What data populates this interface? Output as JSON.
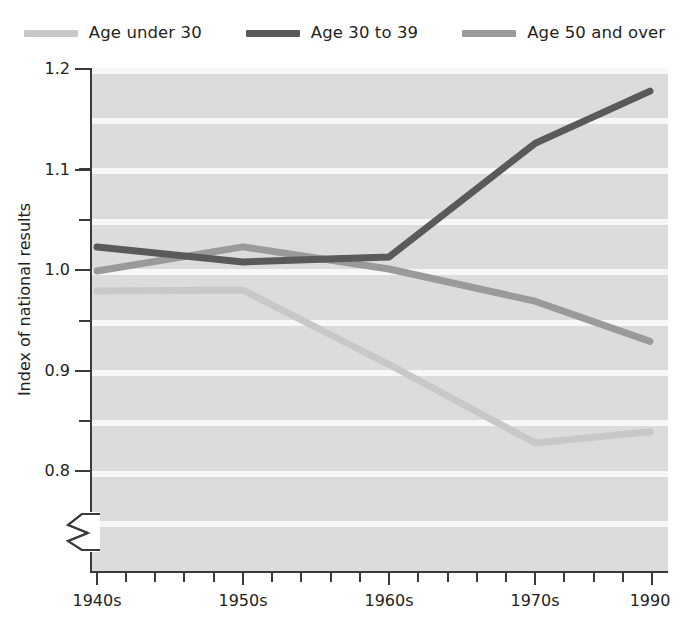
{
  "legend": {
    "position": "top-center",
    "entries": [
      {
        "label": "Age under 30",
        "color": "#c8c8c8",
        "swatch_name": "legend-swatch-age-under-30"
      },
      {
        "label": "Age 30 to 39",
        "color": "#5a5a5a",
        "swatch_name": "legend-swatch-age-30-to-39"
      },
      {
        "label": "Age 50 and over",
        "color": "#9a9a9a",
        "swatch_name": "legend-swatch-age-50-and-over"
      }
    ]
  },
  "axes": {
    "y_title": "Index of national results",
    "y_major_ticks": [
      "1.2",
      "1.1",
      "1.0",
      "0.9",
      "0.8"
    ],
    "y_minor_count_between": 1,
    "x_ticks": [
      "1940s",
      "1950s",
      "1960s",
      "1970s",
      "1990"
    ],
    "x_minor_count_between": 4,
    "axis_break": true
  },
  "chart_data": {
    "type": "line",
    "title": "",
    "xlabel": "",
    "ylabel": "Index of national results",
    "categories": [
      "1940s",
      "1950s",
      "1960s",
      "1970s",
      "1990"
    ],
    "x": [
      1945,
      1955,
      1965,
      1975,
      1990
    ],
    "ylim": [
      0.8,
      1.2
    ],
    "xlim": [
      "1940s",
      "1990"
    ],
    "grid": true,
    "grid_style": "horizontal-banded",
    "legend_position": "top-center",
    "series": [
      {
        "name": "Age under 30",
        "color": "#c8c8c8",
        "values": [
          0.978,
          0.979,
          0.905,
          0.827,
          0.838
        ]
      },
      {
        "name": "Age 30 to 39",
        "color": "#5a5a5a",
        "values": [
          1.022,
          1.007,
          1.012,
          1.125,
          1.177
        ]
      },
      {
        "name": "Age 50 and over",
        "color": "#9a9a9a",
        "values": [
          0.998,
          1.022,
          1.0,
          0.968,
          0.928
        ]
      }
    ]
  },
  "colors": {
    "plot_background": "#dcdcdc",
    "gridline": "#f7f7f7",
    "axis": "#3a3a3a",
    "text": "#231f20"
  }
}
